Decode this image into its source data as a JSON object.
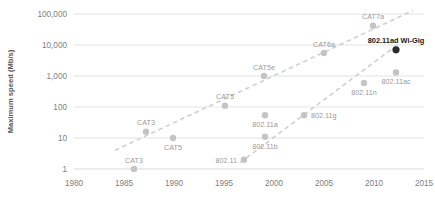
{
  "chart_data": {
    "type": "scatter",
    "title": "",
    "xlabel": "",
    "ylabel": "Maximum speed (Mb/s)",
    "yscale": "log",
    "ylim": [
      1,
      100000
    ],
    "xlim": [
      1980,
      2015
    ],
    "grid": true,
    "legend": "none",
    "y_ticks": [
      "1",
      "10",
      "100",
      "1,000",
      "10,000",
      "100,000"
    ],
    "y_tick_values": [
      1,
      10,
      100,
      1000,
      10000,
      100000
    ],
    "x_ticks": [
      "1980",
      "1985",
      "1990",
      "1995",
      "2000",
      "2005",
      "2010",
      "2015"
    ],
    "x_tick_values": [
      1980,
      1985,
      1990,
      1995,
      2000,
      2005,
      2010,
      2015
    ],
    "series": [
      {
        "name": "Ethernet cabling",
        "trendline": {
          "x0": 1984.1,
          "y0": 4,
          "x1": 2013.9,
          "y1": 130000
        },
        "points": [
          {
            "label": "CAT3",
            "x": 1986.0,
            "y": 1,
            "label_pos": "above",
            "highlight": false
          },
          {
            "label": "CAT3",
            "x": 1987.2,
            "y": 16,
            "label_pos": "above",
            "highlight": false
          },
          {
            "label": "CAT5",
            "x": 1989.9,
            "y": 10,
            "label_pos": "below",
            "highlight": false
          },
          {
            "label": "CAT5",
            "x": 1995.1,
            "y": 110,
            "label_pos": "above",
            "highlight": false
          },
          {
            "label": "CAT5e",
            "x": 1999.0,
            "y": 1000,
            "label_pos": "above",
            "highlight": false
          },
          {
            "label": "CAT6a",
            "x": 2005.0,
            "y": 5500,
            "label_pos": "above",
            "highlight": false
          },
          {
            "label": "CAT7a",
            "x": 2009.9,
            "y": 42000,
            "label_pos": "above",
            "highlight": false
          }
        ]
      },
      {
        "name": "Wi-Fi standards",
        "trendline": {
          "x0": 1996.6,
          "y0": 1.6,
          "x1": 2012.4,
          "y1": 10500
        },
        "points": [
          {
            "label": "802.11",
            "x": 1997.0,
            "y": 2,
            "label_pos": "left",
            "highlight": false
          },
          {
            "label": "802.11b",
            "x": 1999.1,
            "y": 11,
            "label_pos": "below",
            "highlight": false
          },
          {
            "label": "802.11a",
            "x": 1999.1,
            "y": 54,
            "label_pos": "below",
            "highlight": false
          },
          {
            "label": "802.11g",
            "x": 2003.0,
            "y": 54,
            "label_pos": "right",
            "highlight": false
          },
          {
            "label": "802.11n",
            "x": 2009.0,
            "y": 600,
            "label_pos": "below",
            "highlight": false
          },
          {
            "label": "802.11ac",
            "x": 2012.2,
            "y": 1300,
            "label_pos": "below",
            "highlight": false
          },
          {
            "label": "802.11ad Wi-Gig",
            "x": 2012.2,
            "y": 7000,
            "label_pos": "above",
            "highlight": true
          }
        ]
      }
    ],
    "colors": {
      "marker": "#c4c4c4",
      "marker_highlight": "#2b2b2b",
      "trendline": "#cfcfcf",
      "gridline": "#e3e3e3",
      "tick_text": "#808080",
      "axis_title": "#595959",
      "label_text": "#9a9a9a",
      "label_highlight": "#1a1a1a",
      "background": "#ffffff"
    }
  }
}
